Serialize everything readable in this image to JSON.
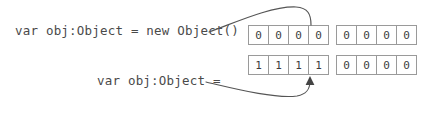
{
  "diagram": {
    "background_color": "#ffffff",
    "labels": {
      "top_code": "var obj:Object = new Object()",
      "bottom_code": "var obj:Object ="
    },
    "colors": {
      "text": "#4a4a4a",
      "cell_border": "#9a9a9a",
      "cell_fill": "#ffffff",
      "cell_text": "#3d3d3d",
      "arrow": "#555555"
    },
    "memory_groups": [
      {
        "name": "group-a",
        "rows": [
          {
            "name": "group-a-row-top",
            "cells": [
              "0",
              "0",
              "0",
              "0"
            ]
          },
          {
            "name": "group-a-row-bottom",
            "cells": [
              "1",
              "1",
              "1",
              "1"
            ]
          }
        ]
      },
      {
        "name": "group-b",
        "rows": [
          {
            "name": "group-b-row-top",
            "cells": [
              "0",
              "0",
              "0",
              "0"
            ]
          },
          {
            "name": "group-b-row-bottom",
            "cells": [
              "0",
              "0",
              "0",
              "0"
            ]
          }
        ]
      }
    ],
    "connectors": [
      {
        "name": "top-connector",
        "from_label": "top_code",
        "to_target": "group-a-row-top",
        "has_arrowhead": false
      },
      {
        "name": "bottom-connector",
        "from_label": "bottom_code",
        "to_target": "group-a-row-bottom",
        "has_arrowhead": true
      }
    ]
  }
}
